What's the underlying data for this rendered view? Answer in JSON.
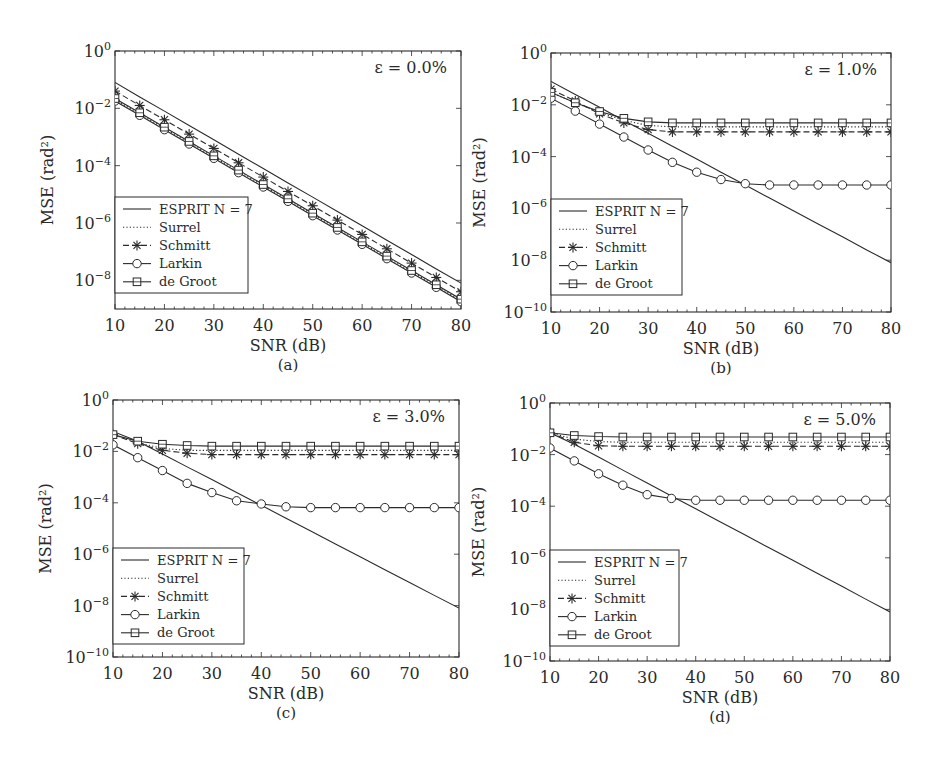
{
  "figure": {
    "legend_entries": [
      {
        "label": "ESPRIT N = 7",
        "style": "solid",
        "marker": "none"
      },
      {
        "label": "Surrel",
        "style": "dotted",
        "marker": "none"
      },
      {
        "label": "Schmitt",
        "style": "dashed",
        "marker": "asterisk"
      },
      {
        "label": "Larkin",
        "style": "solid",
        "marker": "circle"
      },
      {
        "label": "de Groot",
        "style": "solid",
        "marker": "square"
      }
    ],
    "line_color": "#2a2a2a"
  },
  "chart_data": [
    {
      "type": "line",
      "panel": "(a)",
      "annotation": "ε = 0.0%",
      "xlabel": "SNR (dB)",
      "ylabel": "MSE (rad²)",
      "yscale": "log",
      "xlim": [
        10,
        80
      ],
      "ylim": [
        1e-09,
        1
      ],
      "xticks": [
        10,
        20,
        30,
        40,
        50,
        60,
        70,
        80
      ],
      "yticks": [
        1,
        0.01,
        0.0001,
        1e-06,
        1e-08
      ],
      "ytick_labels": [
        "10^0",
        "10^-2",
        "10^-4",
        "10^-6",
        "10^-8"
      ],
      "legend_position": "lower left",
      "grid": false,
      "x": [
        10,
        15,
        20,
        25,
        30,
        35,
        40,
        45,
        50,
        55,
        60,
        65,
        70,
        75,
        80
      ],
      "series": [
        {
          "name": "ESPRIT N = 7",
          "values": [
            0.08,
            0.025,
            0.008,
            0.0025,
            0.0008,
            0.00025,
            8e-05,
            2.5e-05,
            8e-06,
            2.5e-06,
            8e-07,
            2.5e-07,
            8e-08,
            2.5e-08,
            8e-09
          ]
        },
        {
          "name": "Surrel",
          "values": [
            0.02,
            0.0063,
            0.002,
            0.00063,
            0.0002,
            6.3e-05,
            2e-05,
            6.3e-06,
            2e-06,
            6.3e-07,
            2e-07,
            6.3e-08,
            2e-08,
            6.3e-09,
            2e-09
          ]
        },
        {
          "name": "Schmitt",
          "values": [
            0.04,
            0.0126,
            0.004,
            0.00126,
            0.0004,
            0.000126,
            4e-05,
            1.26e-05,
            4e-06,
            1.26e-06,
            4e-07,
            1.26e-07,
            4e-08,
            1.26e-08,
            4e-09
          ]
        },
        {
          "name": "Larkin",
          "values": [
            0.018,
            0.0057,
            0.0018,
            0.00057,
            0.00018,
            5.7e-05,
            1.8e-05,
            5.7e-06,
            1.8e-06,
            5.7e-07,
            1.8e-07,
            5.7e-08,
            1.8e-08,
            5.7e-09,
            1.8e-09
          ]
        },
        {
          "name": "de Groot",
          "values": [
            0.022,
            0.007,
            0.0022,
            0.0007,
            0.00022,
            7e-05,
            2.2e-05,
            7e-06,
            2.2e-06,
            7e-07,
            2.2e-07,
            7e-08,
            2.2e-08,
            7e-09,
            2.2e-09
          ]
        }
      ]
    },
    {
      "type": "line",
      "panel": "(b)",
      "annotation": "ε = 1.0%",
      "xlabel": "SNR (dB)",
      "ylabel": "MSE (rad²)",
      "yscale": "log",
      "xlim": [
        10,
        80
      ],
      "ylim": [
        1e-10,
        1
      ],
      "xticks": [
        10,
        20,
        30,
        40,
        50,
        60,
        70,
        80
      ],
      "yticks": [
        1,
        0.01,
        0.0001,
        1e-06,
        1e-08,
        1e-10
      ],
      "ytick_labels": [
        "10^0",
        "10^-2",
        "10^-4",
        "10^-6",
        "10^-8",
        "10^-10"
      ],
      "legend_position": "lower left",
      "grid": false,
      "x": [
        10,
        15,
        20,
        25,
        30,
        35,
        40,
        45,
        50,
        55,
        60,
        65,
        70,
        75,
        80
      ],
      "series": [
        {
          "name": "ESPRIT N = 7",
          "values": [
            0.08,
            0.025,
            0.008,
            0.0025,
            0.0008,
            0.00025,
            8e-05,
            2.5e-05,
            8e-06,
            2.5e-06,
            8e-07,
            2.5e-07,
            8e-08,
            2.5e-08,
            8e-09
          ]
        },
        {
          "name": "Surrel",
          "values": [
            0.03,
            0.012,
            0.005,
            0.0025,
            0.0016,
            0.0014,
            0.0014,
            0.0014,
            0.0014,
            0.0014,
            0.0014,
            0.0014,
            0.0014,
            0.0014,
            0.0014
          ]
        },
        {
          "name": "Schmitt",
          "values": [
            0.04,
            0.014,
            0.0045,
            0.002,
            0.0011,
            0.0009,
            0.0009,
            0.0009,
            0.0009,
            0.0009,
            0.0009,
            0.0009,
            0.0009,
            0.0009,
            0.0009
          ]
        },
        {
          "name": "Larkin",
          "values": [
            0.018,
            0.0057,
            0.0018,
            0.00057,
            0.00018,
            6e-05,
            2.5e-05,
            1.3e-05,
            9e-06,
            8e-06,
            8e-06,
            8e-06,
            8e-06,
            8e-06,
            8e-06
          ]
        },
        {
          "name": "de Groot",
          "values": [
            0.03,
            0.012,
            0.0055,
            0.003,
            0.0022,
            0.002,
            0.002,
            0.002,
            0.002,
            0.002,
            0.002,
            0.002,
            0.002,
            0.002,
            0.002
          ]
        }
      ]
    },
    {
      "type": "line",
      "panel": "(c)",
      "annotation": "ε = 3.0%",
      "xlabel": "SNR (dB)",
      "ylabel": "MSE (rad²)",
      "yscale": "log",
      "xlim": [
        10,
        80
      ],
      "ylim": [
        1e-10,
        1
      ],
      "xticks": [
        10,
        20,
        30,
        40,
        50,
        60,
        70,
        80
      ],
      "yticks": [
        1,
        0.01,
        0.0001,
        1e-06,
        1e-08,
        1e-10
      ],
      "ytick_labels": [
        "10^0",
        "10^-2",
        "10^-4",
        "10^-6",
        "10^-8",
        "10^-10"
      ],
      "legend_position": "lower left",
      "grid": false,
      "x": [
        10,
        15,
        20,
        25,
        30,
        35,
        40,
        45,
        50,
        55,
        60,
        65,
        70,
        75,
        80
      ],
      "series": [
        {
          "name": "ESPRIT N = 7",
          "values": [
            0.06,
            0.025,
            0.008,
            0.0025,
            0.0008,
            0.00025,
            8e-05,
            2.5e-05,
            8e-06,
            2.5e-06,
            8e-07,
            2.5e-07,
            8e-08,
            2.5e-08,
            8e-09
          ]
        },
        {
          "name": "Surrel",
          "values": [
            0.045,
            0.022,
            0.013,
            0.011,
            0.011,
            0.011,
            0.011,
            0.011,
            0.011,
            0.011,
            0.011,
            0.011,
            0.011,
            0.011,
            0.011
          ]
        },
        {
          "name": "Schmitt",
          "values": [
            0.045,
            0.02,
            0.011,
            0.0085,
            0.0075,
            0.0075,
            0.0075,
            0.0075,
            0.0075,
            0.0075,
            0.0075,
            0.0075,
            0.0075,
            0.0075,
            0.0075
          ]
        },
        {
          "name": "Larkin",
          "values": [
            0.018,
            0.0057,
            0.0018,
            0.00057,
            0.00025,
            0.00012,
            9e-05,
            7e-05,
            6.5e-05,
            6.5e-05,
            6.5e-05,
            6.5e-05,
            6.5e-05,
            6.5e-05,
            6.5e-05
          ]
        },
        {
          "name": "de Groot",
          "values": [
            0.045,
            0.025,
            0.019,
            0.017,
            0.016,
            0.016,
            0.016,
            0.016,
            0.016,
            0.016,
            0.016,
            0.016,
            0.016,
            0.016,
            0.016
          ]
        }
      ]
    },
    {
      "type": "line",
      "panel": "(d)",
      "annotation": "ε = 5.0%",
      "xlabel": "SNR (dB)",
      "ylabel": "MSE (rad²)",
      "yscale": "log",
      "xlim": [
        10,
        80
      ],
      "ylim": [
        1e-10,
        1
      ],
      "xticks": [
        10,
        20,
        30,
        40,
        50,
        60,
        70,
        80
      ],
      "yticks": [
        1,
        0.01,
        0.0001,
        1e-06,
        1e-08,
        1e-10
      ],
      "ytick_labels": [
        "10^0",
        "10^-2",
        "10^-4",
        "10^-6",
        "10^-8",
        "10^-10"
      ],
      "legend_position": "lower left",
      "grid": false,
      "x": [
        10,
        15,
        20,
        25,
        30,
        35,
        40,
        45,
        50,
        55,
        60,
        65,
        70,
        75,
        80
      ],
      "series": [
        {
          "name": "ESPRIT N = 7",
          "values": [
            0.07,
            0.025,
            0.008,
            0.0025,
            0.0008,
            0.00025,
            8e-05,
            2.5e-05,
            8e-06,
            2.5e-06,
            8e-07,
            2.5e-07,
            8e-08,
            2.5e-08,
            8e-09
          ]
        },
        {
          "name": "Surrel",
          "values": [
            0.07,
            0.04,
            0.032,
            0.03,
            0.03,
            0.03,
            0.03,
            0.03,
            0.03,
            0.03,
            0.03,
            0.03,
            0.03,
            0.03,
            0.03
          ]
        },
        {
          "name": "Schmitt",
          "values": [
            0.07,
            0.03,
            0.022,
            0.021,
            0.021,
            0.021,
            0.021,
            0.021,
            0.021,
            0.021,
            0.021,
            0.021,
            0.021,
            0.021,
            0.021
          ]
        },
        {
          "name": "Larkin",
          "values": [
            0.018,
            0.0057,
            0.0018,
            0.00065,
            0.00028,
            0.0002,
            0.00017,
            0.00017,
            0.00017,
            0.00017,
            0.00017,
            0.00017,
            0.00017,
            0.00017,
            0.00017
          ]
        },
        {
          "name": "de Groot",
          "values": [
            0.07,
            0.055,
            0.05,
            0.048,
            0.048,
            0.048,
            0.048,
            0.048,
            0.048,
            0.048,
            0.048,
            0.048,
            0.048,
            0.048,
            0.048
          ]
        }
      ]
    }
  ]
}
